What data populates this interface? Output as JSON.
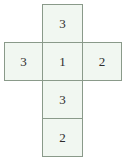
{
  "figure": {
    "name": "cube-net",
    "type": "net-diagram",
    "shape": "cross",
    "columns": 3,
    "rows": 4,
    "colors": {
      "cell_fill": "#f1f7f1",
      "cell_border": "#8a9a8a",
      "text": "#2e2e2e",
      "background": "#ffffff"
    }
  },
  "chart_data": {
    "type": "table",
    "title": "",
    "xlabel": "",
    "ylabel": "",
    "grid": true,
    "columns": [
      "left",
      "center",
      "right"
    ],
    "rows": [
      [
        null,
        "3",
        null
      ],
      [
        "3",
        "1",
        "2"
      ],
      [
        null,
        "3",
        null
      ],
      [
        null,
        "2",
        null
      ]
    ],
    "values": [
      3,
      3,
      1,
      2,
      3,
      2
    ],
    "annotations": []
  },
  "cells": {
    "top": {
      "label": "3",
      "row": 1,
      "col": "center"
    },
    "middle_left": {
      "label": "3",
      "row": 2,
      "col": "left"
    },
    "middle_center": {
      "label": "1",
      "row": 2,
      "col": "center"
    },
    "middle_right": {
      "label": "2",
      "row": 2,
      "col": "right"
    },
    "lower": {
      "label": "3",
      "row": 3,
      "col": "center"
    },
    "bottom": {
      "label": "2",
      "row": 4,
      "col": "center"
    }
  }
}
